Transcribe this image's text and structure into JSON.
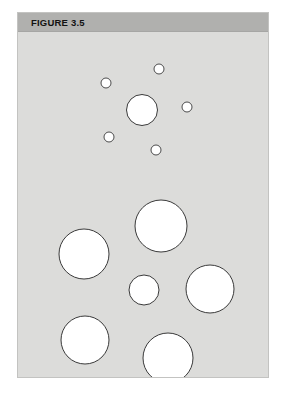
{
  "figure": {
    "label": "FIGURE 3.5",
    "panel_background": "#dcdcda",
    "header_background": "#b0b0ae",
    "page_background": "#ffffff",
    "circle_fill": "#ffffff",
    "circle_stroke": "#3a3a3a"
  },
  "chart_data": {
    "type": "scatter",
    "title": "FIGURE 3.5",
    "subtitle": "",
    "xlabel": "",
    "ylabel": "",
    "grid": false,
    "legend": "none",
    "annotations": [],
    "xlim": [
      0,
      250
    ],
    "ylim": [
      0,
      345
    ],
    "marker_style": "open-circle",
    "series": [
      {
        "name": "circles",
        "points": [
          {
            "id": "c1",
            "x": 141,
            "y": 37,
            "r": 5
          },
          {
            "id": "c2",
            "x": 88,
            "y": 51,
            "r": 5
          },
          {
            "id": "c3",
            "x": 124,
            "y": 78,
            "r": 15.5
          },
          {
            "id": "c4",
            "x": 169,
            "y": 75,
            "r": 5
          },
          {
            "id": "c5",
            "x": 91,
            "y": 105,
            "r": 5
          },
          {
            "id": "c6",
            "x": 138,
            "y": 118,
            "r": 5
          },
          {
            "id": "c7",
            "x": 143,
            "y": 194,
            "r": 26
          },
          {
            "id": "c8",
            "x": 66,
            "y": 222,
            "r": 25
          },
          {
            "id": "c9",
            "x": 126,
            "y": 258,
            "r": 15
          },
          {
            "id": "c10",
            "x": 192,
            "y": 257,
            "r": 24
          },
          {
            "id": "c11",
            "x": 67,
            "y": 308,
            "r": 24
          },
          {
            "id": "c12",
            "x": 150,
            "y": 326,
            "r": 25
          }
        ]
      }
    ],
    "counts": {
      "total_circles": 12,
      "small_circles": 5,
      "medium_circles": 2,
      "large_circles": 5
    }
  }
}
